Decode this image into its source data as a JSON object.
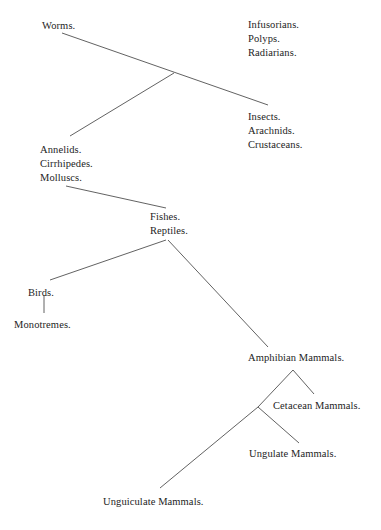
{
  "diagram": {
    "type": "cladogram",
    "background_color": "#ffffff",
    "line_color": "#3a3a3a",
    "text_color": "#1d1d1d",
    "nodes": [
      {
        "id": "worms",
        "lines": [
          "Worms."
        ],
        "x": 42,
        "y": 19,
        "text": "Worms."
      },
      {
        "id": "infusorians-group",
        "lines": [
          "Infusorians.",
          "Polyps.",
          "Radiarians."
        ],
        "x": 248,
        "y": 18,
        "text": "Infusorians.\nPolyps.\nRadiarians."
      },
      {
        "id": "insects-group",
        "lines": [
          "Insects.",
          "Arachnids.",
          "Crustaceans."
        ],
        "x": 248,
        "y": 110,
        "text": "Insects.\nArachnids.\nCrustaceans."
      },
      {
        "id": "annelids-group",
        "lines": [
          "Annelids.",
          "Cirrhipedes.",
          "Molluscs."
        ],
        "x": 40,
        "y": 143,
        "text": "Annelids.\nCirrhipedes.\nMolluscs."
      },
      {
        "id": "fishes-reptiles",
        "lines": [
          "Fishes.",
          "Reptiles."
        ],
        "x": 150,
        "y": 210,
        "text": "Fishes.\nReptiles."
      },
      {
        "id": "birds",
        "lines": [
          "Birds."
        ],
        "x": 28,
        "y": 286,
        "text": "Birds."
      },
      {
        "id": "monotremes",
        "lines": [
          "Monotremes."
        ],
        "x": 14,
        "y": 318,
        "text": "Monotremes."
      },
      {
        "id": "amphibian-mammals",
        "lines": [
          "Amphibian Mammals."
        ],
        "x": 248,
        "y": 351,
        "text": "Amphibian Mammals."
      },
      {
        "id": "cetacean-mammals",
        "lines": [
          "Cetacean Mammals."
        ],
        "x": 273,
        "y": 399,
        "text": "Cetacean Mammals."
      },
      {
        "id": "ungulate-mammals",
        "lines": [
          "Ungulate Mammals."
        ],
        "x": 249,
        "y": 447,
        "text": "Ungulate Mammals."
      },
      {
        "id": "unguiculate-mammals",
        "lines": [
          "Unguiculate Mammals."
        ],
        "x": 103,
        "y": 495,
        "text": "Unguiculate Mammals."
      }
    ],
    "edges": [
      {
        "id": "worms-to-insects",
        "x1": 62,
        "y1": 33,
        "x2": 268,
        "y2": 105
      },
      {
        "id": "annelids-to-junction",
        "x1": 70,
        "y1": 136,
        "x2": 174,
        "y2": 73
      },
      {
        "id": "molluscs-to-fishes",
        "x1": 66,
        "y1": 186,
        "x2": 166,
        "y2": 208
      },
      {
        "id": "reptiles-to-birds",
        "x1": 166,
        "y1": 240,
        "x2": 50,
        "y2": 280
      },
      {
        "id": "birds-to-monotremes",
        "x1": 44,
        "y1": 295,
        "x2": 44,
        "y2": 313
      },
      {
        "id": "reptiles-to-amphibian-mammals",
        "x1": 168,
        "y1": 240,
        "x2": 268,
        "y2": 347
      },
      {
        "id": "amphibian-to-cetacean",
        "x1": 293,
        "y1": 370,
        "x2": 314,
        "y2": 394
      },
      {
        "id": "amphibian-to-lower-junction",
        "x1": 293,
        "y1": 370,
        "x2": 258,
        "y2": 407
      },
      {
        "id": "junction-to-ungulate",
        "x1": 258,
        "y1": 407,
        "x2": 299,
        "y2": 443
      },
      {
        "id": "junction-to-unguiculate",
        "x1": 258,
        "y1": 407,
        "x2": 160,
        "y2": 488
      }
    ]
  }
}
